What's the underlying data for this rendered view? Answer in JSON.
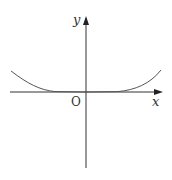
{
  "figure": {
    "axes": {
      "x_label": "x",
      "y_label": "y",
      "origin_label": "O"
    },
    "colors": {
      "axis": "#333333",
      "curve": "#555555",
      "background": "#ffffff"
    }
  }
}
